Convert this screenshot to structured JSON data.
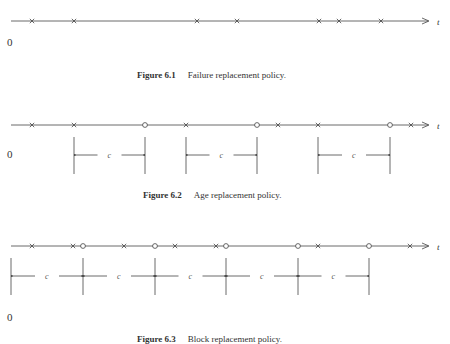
{
  "figures": [
    {
      "id": "fig61",
      "number": "Figure 6.1",
      "title": "Failure replacement policy.",
      "axis_label": "t",
      "origin_label": "0",
      "failures_x": [
        32,
        74,
        197,
        237,
        319,
        339,
        381
      ],
      "preventive_x": [],
      "intervals": []
    },
    {
      "id": "fig62",
      "number": "Figure 6.2",
      "title": "Age replacement policy.",
      "axis_label": "t",
      "origin_label": "0",
      "failures_x": [
        32,
        74,
        186,
        278,
        318,
        411
      ],
      "preventive_x": [
        145,
        257,
        390
      ],
      "interval_label": "c",
      "intervals": [
        [
          74,
          145
        ],
        [
          186,
          257
        ],
        [
          318,
          390
        ]
      ]
    },
    {
      "id": "fig63",
      "number": "Figure 6.3",
      "title": "Block replacement policy.",
      "note": "caption text inferred; only a faint partial line is visible in the screenshot",
      "axis_label": "t",
      "origin_label": "0",
      "failures_x": [
        32,
        73,
        124,
        175,
        216,
        318,
        410
      ],
      "preventive_x": [
        83,
        155,
        226,
        298,
        369
      ],
      "interval_label": "c",
      "intervals": [
        [
          11,
          83
        ],
        [
          83,
          155
        ],
        [
          155,
          226
        ],
        [
          226,
          298
        ],
        [
          298,
          369
        ]
      ]
    }
  ]
}
